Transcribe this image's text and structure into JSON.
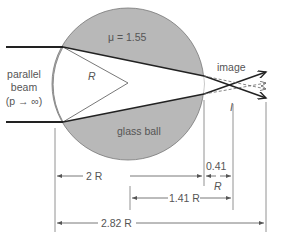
{
  "diagram": {
    "colors": {
      "ball_fill": "#b8b8b8",
      "ray": "#222222",
      "dimension_line": "#555555",
      "text": "#555555"
    },
    "labels": {
      "refractive_index": "μ = 1.55",
      "radius": "R",
      "beam_line1": "parallel",
      "beam_line2": "beam",
      "beam_line3": "(p → ∞)",
      "image": "image",
      "image_marker": "I",
      "ball": "glass ball"
    },
    "dimensions": {
      "diameter": "2 R",
      "image_distance_num": "0.41",
      "image_distance_unit": "R",
      "from_center": "1.41 R",
      "total": "2.82 R"
    }
  }
}
